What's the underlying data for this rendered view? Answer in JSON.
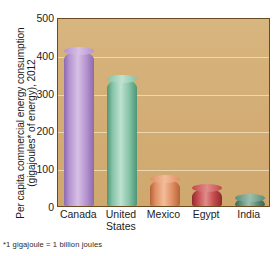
{
  "figure": {
    "footnote": "*1 gigajoule = 1 billion joules",
    "background_color": "#ffffff",
    "plot_background_color": "#d3ad75",
    "plot_border_color": "#6b4a22",
    "gridline_color": "#efdcb8"
  },
  "axis": {
    "ylabel_line1": "Per capita commercial energy consumption",
    "ylabel_line2": "(gigajoules* of energy), 2012",
    "yticks": [
      "0",
      "100",
      "200",
      "300",
      "400",
      "500"
    ]
  },
  "chart_data": {
    "type": "bar",
    "title": "",
    "xlabel": "",
    "ylabel": "Per capita commercial energy consumption (gigajoules* of energy), 2012",
    "categories": [
      "Canada",
      "United States",
      "Mexico",
      "Egypt",
      "India"
    ],
    "values": [
      410,
      335,
      72,
      47,
      20
    ],
    "ylim": [
      0,
      500
    ],
    "ytick_values": [
      0,
      100,
      200,
      300,
      400,
      500
    ],
    "grid": true,
    "legend": "none",
    "bar_colors": [
      "#b594cf",
      "#84c3a6",
      "#e08f63",
      "#c4484a",
      "#5d8d78"
    ],
    "note": "*1 gigajoule = 1 billion joules"
  },
  "categories": [
    {
      "name": "Canada",
      "line1": "Canada",
      "line2": "",
      "value": 410,
      "color_light": "#d7c0e6",
      "color_mid": "#b594cf",
      "color_dark": "#8d6aae"
    },
    {
      "name": "United States",
      "line1": "United",
      "line2": "States",
      "value": 335,
      "color_light": "#bfe2d1",
      "color_mid": "#84c3a6",
      "color_dark": "#4e9476"
    },
    {
      "name": "Mexico",
      "line1": "Mexico",
      "line2": "",
      "value": 72,
      "color_light": "#f2bd9b",
      "color_mid": "#e08f63",
      "color_dark": "#b5623a"
    },
    {
      "name": "Egypt",
      "line1": "Egypt",
      "line2": "",
      "value": 47,
      "color_light": "#e08c8c",
      "color_mid": "#c4484a",
      "color_dark": "#8d2b2f"
    },
    {
      "name": "India",
      "line1": "India",
      "line2": "",
      "value": 20,
      "color_light": "#9cbfae",
      "color_mid": "#5d8d78",
      "color_dark": "#3a6352"
    }
  ]
}
